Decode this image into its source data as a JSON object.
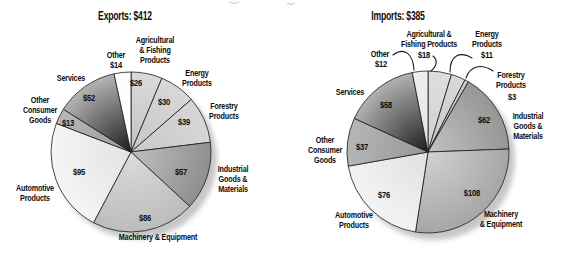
{
  "figure": {
    "background": "#ffffff",
    "text_color": "#0d0d0d",
    "stroke_color": "#1a1a1a",
    "shadow_color": "#999999"
  },
  "chart_data": [
    {
      "type": "pie",
      "title": "Exports: $412",
      "total": 412,
      "start_angle_deg": 0,
      "clockwise": true,
      "center": [
        131,
        152
      ],
      "radius_px": 80,
      "title_pos": [
        125,
        20
      ],
      "slices": [
        {
          "name": "Agricultural & Fishing Products",
          "value": 26,
          "value_label": "$26",
          "value_pos": [
            136,
            86
          ],
          "label_lines": [
            "Agricultural",
            "& Fishing",
            "Products"
          ],
          "label_pos": [
            155,
            43
          ],
          "inner": "#c2c2c2",
          "outer": "#dadada"
        },
        {
          "name": "Energy Products",
          "value": 30,
          "value_label": "$30",
          "value_pos": [
            164,
            105
          ],
          "label_lines": [
            "Energy",
            "Products"
          ],
          "label_pos": [
            197,
            76
          ],
          "inner": "#c6c6c6",
          "outer": "#d8d8d8"
        },
        {
          "name": "Forestry Products",
          "value": 39,
          "value_label": "$39",
          "value_pos": [
            184,
            125
          ],
          "label_lines": [
            "Forestry",
            "Products"
          ],
          "label_pos": [
            224,
            109
          ],
          "inner": "#c8c8c8",
          "outer": "#d6d6d6"
        },
        {
          "name": "Industrial Goods & Materials",
          "value": 57,
          "value_label": "$57",
          "value_pos": [
            181,
            175
          ],
          "label_lines": [
            "Industrial",
            "Goods &",
            "Materials"
          ],
          "label_pos": [
            233,
            172
          ],
          "inner": "#c0c0c0",
          "outer": "#8f8f8f"
        },
        {
          "name": "Machinery & Equipment",
          "value": 86,
          "value_label": "$86",
          "value_pos": [
            145,
            221
          ],
          "label_lines": [
            "Machinery & Equipment"
          ],
          "label_pos": [
            158,
            240
          ],
          "inner": "#dcdcdc",
          "outer": "#bcbcbc"
        },
        {
          "name": "Automotive Products",
          "value": 95,
          "value_label": "$95",
          "value_pos": [
            79,
            175
          ],
          "label_lines": [
            "Automotive",
            "Products"
          ],
          "label_pos": [
            35,
            191
          ],
          "inner": "#e2e2e2",
          "outer": "#f5f5f5"
        },
        {
          "name": "Other Consumer Goods",
          "value": 13,
          "value_label": "$13",
          "value_pos": [
            68,
            126
          ],
          "label_lines": [
            "Other",
            "Consumer",
            "Goods"
          ],
          "label_pos": [
            40,
            103
          ],
          "inner": "#9a9a9a",
          "outer": "#b8b8b8"
        },
        {
          "name": "Services",
          "value": 52,
          "value_label": "$52",
          "value_pos": [
            89,
            101
          ],
          "label_lines": [
            "Services"
          ],
          "label_pos": [
            71,
            81
          ],
          "inner": "#1c1c1c",
          "outer": "#b4b4b4"
        },
        {
          "name": "Other",
          "value": 14,
          "value_label": "$14",
          "value_pos": [
            116,
            68
          ],
          "label_lines": [
            "Other"
          ],
          "label_pos": [
            116,
            58
          ],
          "inner": "#ffffff",
          "outer": "#fdfdfd"
        }
      ]
    },
    {
      "type": "pie",
      "title": "Imports: $385",
      "total": 385,
      "start_angle_deg": 0,
      "clockwise": true,
      "center": [
        428,
        152
      ],
      "radius_px": 81,
      "title_pos": [
        398,
        20
      ],
      "slices": [
        {
          "name": "Agricultural & Fishing Products",
          "value": 18,
          "value_label": "$18",
          "value_pos": [
            424,
            58
          ],
          "label_lines": [
            "Agricultural &",
            "Fishing Products"
          ],
          "label_pos": [
            429,
            37
          ],
          "leader": "M433,56 C438,60 437,66 431,71",
          "inner": "#cfcfcf",
          "outer": "#dedede"
        },
        {
          "name": "Energy Products",
          "value": 11,
          "value_label": "$11",
          "value_pos": [
            487,
            58
          ],
          "label_lines": [
            "Energy",
            "Products"
          ],
          "label_pos": [
            487,
            37
          ],
          "leader": "M472,58 C460,51 450,55 450,72",
          "inner": "#c8c8c8",
          "outer": "#d8d8d8"
        },
        {
          "name": "Forestry Products",
          "value": 3,
          "value_label": "$3",
          "value_pos": [
            512,
            100
          ],
          "label_lines": [
            "Forestry",
            "Products"
          ],
          "label_pos": [
            511,
            78
          ],
          "leader": "M493,71 C481,63 470,66 466,78",
          "inner": "#b8b8b8",
          "outer": "#cccccc"
        },
        {
          "name": "Industrial Goods & Materials",
          "value": 62,
          "value_label": "$62",
          "value_pos": [
            484,
            123
          ],
          "label_lines": [
            "Industrial",
            "Goods &",
            "Materials"
          ],
          "label_pos": [
            528,
            119
          ],
          "inner": "#c2c2c2",
          "outer": "#969696"
        },
        {
          "name": "Machinery & Equipment",
          "value": 108,
          "value_label": "$108",
          "value_pos": [
            472,
            196
          ],
          "label_lines": [
            "Machinery",
            "& Equipment"
          ],
          "label_pos": [
            501,
            217
          ],
          "inner": "#d2d2d2",
          "outer": "#a6a6a6"
        },
        {
          "name": "Automotive Products",
          "value": 76,
          "value_label": "$76",
          "value_pos": [
            384,
            198
          ],
          "label_lines": [
            "Automotive",
            "Products"
          ],
          "label_pos": [
            354,
            218
          ],
          "inner": "#e0e0e0",
          "outer": "#f3f3f3"
        },
        {
          "name": "Other Consumer Goods",
          "value": 37,
          "value_label": "$37",
          "value_pos": [
            362,
            150
          ],
          "label_lines": [
            "Other",
            "Consumer",
            "Goods"
          ],
          "label_pos": [
            325,
            143
          ],
          "inner": "#969696",
          "outer": "#b6b6b6"
        },
        {
          "name": "Services",
          "value": 58,
          "value_label": "$58",
          "value_pos": [
            386,
            108
          ],
          "label_lines": [
            "Services"
          ],
          "label_pos": [
            350,
            95
          ],
          "inner": "#1c1c1c",
          "outer": "#b2b2b2"
        },
        {
          "name": "Other",
          "value": 12,
          "value_label": "$12",
          "value_pos": [
            381,
            67
          ],
          "label_lines": [
            "Other"
          ],
          "label_pos": [
            380,
            57
          ],
          "leader": "M393,55 C404,47 413,53 414,70",
          "inner": "#e5e5e5",
          "outer": "#eeeeee"
        }
      ]
    }
  ]
}
